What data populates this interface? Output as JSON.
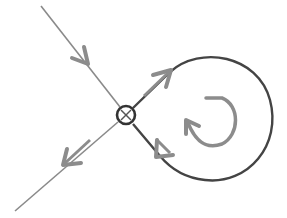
{
  "diagram": {
    "title": "Homoclinic orbit at saddle point",
    "colors": {
      "background": "#ffffff",
      "line_light": "#8a8a8a",
      "line_dark": "#444444",
      "arrow": "#8c8c8c"
    },
    "elements": [
      {
        "id": "saddle-point",
        "type": "circle",
        "label": "saddle point"
      },
      {
        "id": "stable-manifold",
        "type": "line",
        "label": "incoming trajectory"
      },
      {
        "id": "unstable-manifold",
        "type": "line",
        "label": "outgoing trajectory"
      },
      {
        "id": "homoclinic-loop",
        "type": "loop",
        "label": "homoclinic orbit"
      },
      {
        "id": "rotation-indicator",
        "type": "curved-arrow",
        "label": "counterclockwise rotation"
      }
    ]
  }
}
